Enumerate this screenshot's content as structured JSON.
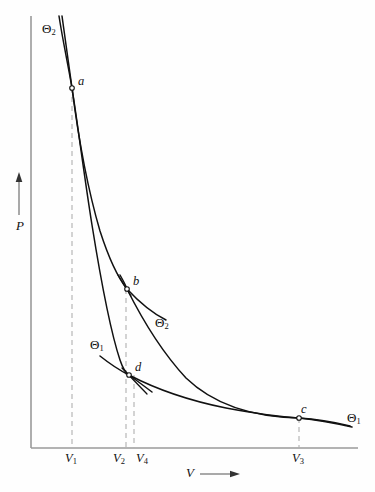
{
  "figure": {
    "type": "pv-diagram"
  },
  "axes": {
    "y_label": "P",
    "x_label": "V",
    "y_arrow": "up-arrow",
    "x_arrow": "right-arrow",
    "axis_color": "#9a9a9a",
    "origin": {
      "x": 31,
      "y": 448
    },
    "x_end": 358,
    "y_top": 16
  },
  "curve_color": "#111111",
  "dash_color": "#b0b0b0",
  "points": [
    {
      "id": "a",
      "label": "a",
      "x": 72,
      "y": 88,
      "label_dx": 6,
      "label_dy": -13
    },
    {
      "id": "b",
      "label": "b",
      "x": 127,
      "y": 289,
      "label_dx": 6,
      "label_dy": -14
    },
    {
      "id": "c",
      "label": "c",
      "x": 299,
      "y": 418,
      "label_dx": 2,
      "label_dy": -15
    },
    {
      "id": "d",
      "label": "d",
      "x": 129,
      "y": 375,
      "label_dx": 6,
      "label_dy": -14
    }
  ],
  "isotherm_labels": [
    {
      "id": "theta2-top",
      "text": "Θ",
      "sub": "2",
      "x": 42,
      "y": 22
    },
    {
      "id": "theta2-mid",
      "text": "Θ",
      "sub": "2",
      "x": 155,
      "y": 316
    },
    {
      "id": "theta1-mid",
      "text": "Θ",
      "sub": "1",
      "x": 90,
      "y": 338
    },
    {
      "id": "theta1-right",
      "text": "Θ",
      "sub": "1",
      "x": 347,
      "y": 411
    }
  ],
  "volume_ticks": [
    {
      "id": "V1",
      "text": "V",
      "sub": "1",
      "x": 72,
      "label_x": 65,
      "label_y": 452
    },
    {
      "id": "V2",
      "text": "V",
      "sub": "2",
      "x": 126,
      "label_x": 113,
      "label_y": 452
    },
    {
      "id": "V4",
      "text": "V",
      "sub": "4",
      "x": 134,
      "label_x": 136,
      "label_y": 452
    },
    {
      "id": "V3",
      "text": "V",
      "sub": "3",
      "x": 299,
      "label_x": 292,
      "label_y": 452
    }
  ],
  "curves": {
    "isotherm_theta2": {
      "name": "Θ₂ isotherm (a to b)",
      "path": "M 62 16 C 66 45, 69 66, 72 88 C 78 135, 88 190, 100 231 C 110 262, 119 279, 127 289 C 140 303, 152 313, 166 320"
    },
    "adiabat_ad": {
      "name": "adiabat a to d",
      "path": "M 59 16 C 63 42, 68 64, 72 88 C 78 126, 84 175, 92 225 C 100 275, 110 330, 120 360 C 123 369, 126 373, 129 375 C 136 380, 144 386, 152 392"
    },
    "adiabat_bc": {
      "name": "adiabat b to c",
      "path": "M 120 275 C 124 282, 126 286, 127 289 C 140 315, 160 350, 186 378 C 214 405, 255 417, 299 418 C 318 419, 334 422, 350 426"
    },
    "isotherm_theta1": {
      "name": "Θ₁ isotherm (d to c)",
      "path": "M 100 356 C 110 364, 121 371, 129 375 C 152 387, 186 400, 226 408 C 258 414, 281 417, 299 418 C 318 420, 334 423, 352 427"
    }
  },
  "tangents": [
    {
      "id": "tangent-at-b",
      "x1": 118,
      "y1": 275,
      "x2": 131,
      "y2": 296
    },
    {
      "id": "tangent-at-d",
      "x1": 122,
      "y1": 368,
      "x2": 147,
      "y2": 394
    }
  ]
}
